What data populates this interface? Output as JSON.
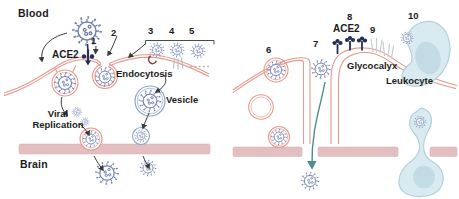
{
  "figure": {
    "panels": {
      "left": {
        "region_top": "Blood",
        "region_bottom": "Brain",
        "labels": {
          "ace2": "ACE2",
          "endocytosis": "Endocytosis",
          "vesicle": "Vesicle",
          "viral_replication_line1": "Viral",
          "viral_replication_line2": "Replication"
        },
        "steps": [
          "1",
          "2",
          "3",
          "4",
          "5"
        ]
      },
      "right": {
        "labels": {
          "ace2": "ACE2",
          "glycocalyx": "Glycocalyx",
          "leukocyte": "Leukocyte"
        },
        "steps": [
          "6",
          "7",
          "8",
          "9",
          "10"
        ]
      }
    },
    "colors": {
      "membrane": "#e49a8d",
      "basement_membrane": "#e3bfc2",
      "virus": "#7182b5",
      "virus_dark": "#4c5f9c",
      "vesicle": "#8ba3cc",
      "ace2_receptor": "#232f55",
      "leukocyte_fill": "#d9ebf1",
      "leukocyte_stroke": "#b2d1dc",
      "nucleus": "#c2dbe4",
      "arrow": "#3a3a3a",
      "paracellular_arrow": "#4a8f8c",
      "glycocalyx": "#c6ccd0",
      "receptor_hook": "#8d4049",
      "strand": "#b9bfc6",
      "label_text": "#1c1c1c"
    }
  }
}
